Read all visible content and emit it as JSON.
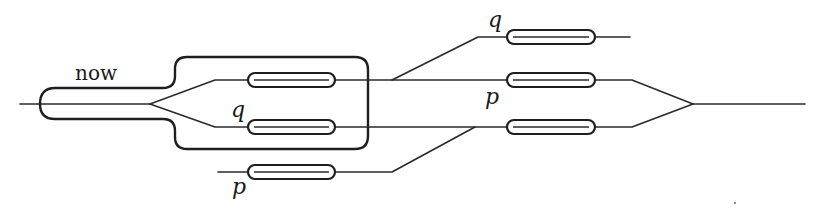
{
  "diagram": {
    "type": "branching timeline / interferometer-style schematic",
    "labels": {
      "now": "now",
      "q_top": "q",
      "q_mid": "q",
      "p_mid": "p",
      "p_bottom": "p"
    },
    "elements": {
      "enclosure": "now-region",
      "left_capsules": [
        "upper-branch",
        "lower-branch",
        "bottom-branch"
      ],
      "right_capsules": [
        "top-branch",
        "upper-branch",
        "lower-branch"
      ]
    },
    "colors": {
      "stroke": "#1e1e1e",
      "background": "#ffffff"
    }
  }
}
